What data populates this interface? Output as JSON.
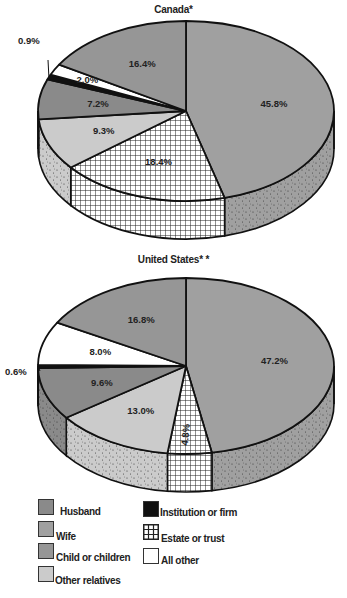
{
  "chart_data": [
    {
      "type": "pie",
      "title": "Canada*",
      "style": "3d",
      "slices": [
        {
          "label": "Wife",
          "value": 45.8,
          "text": "45.8%"
        },
        {
          "label": "Estate or trust",
          "value": 18.4,
          "text": "18.4%"
        },
        {
          "label": "Other relatives",
          "value": 9.3,
          "text": "9.3%"
        },
        {
          "label": "Husband",
          "value": 7.2,
          "text": "7.2%"
        },
        {
          "label": "Institution or firm",
          "value": 0.9,
          "text": "0.9%"
        },
        {
          "label": "All other",
          "value": 2.0,
          "text": "2.0%"
        },
        {
          "label": "Child or children",
          "value": 16.4,
          "text": "16.4%"
        }
      ]
    },
    {
      "type": "pie",
      "title": "United States* *",
      "style": "3d",
      "slices": [
        {
          "label": "Wife",
          "value": 47.2,
          "text": "47.2%"
        },
        {
          "label": "Estate or trust",
          "value": 4.8,
          "text": "4.8%"
        },
        {
          "label": "Other relatives",
          "value": 13.0,
          "text": "13.0%"
        },
        {
          "label": "Husband",
          "value": 9.6,
          "text": "9.6%"
        },
        {
          "label": "Institution or firm",
          "value": 0.6,
          "text": "0.6%"
        },
        {
          "label": "All other",
          "value": 8.0,
          "text": "8.0%"
        },
        {
          "label": "Child or children",
          "value": 16.8,
          "text": "16.8%"
        }
      ]
    }
  ],
  "legend": {
    "left": [
      {
        "label": "Husband",
        "color": "#8a8a8a"
      },
      {
        "label": "Wife",
        "color": "#a0a0a0"
      },
      {
        "label": "Child or children",
        "color": "#969696"
      },
      {
        "label": "Other relatives",
        "color": "#cbcbcb"
      }
    ],
    "right": [
      {
        "label": "Institution or firm",
        "color": "#111111"
      },
      {
        "label": "Estate or trust",
        "color": "hatch"
      },
      {
        "label": "All other",
        "color": "#ffffff"
      }
    ]
  },
  "colors": {
    "Husband": "#8a8a8a",
    "Wife": "#a0a0a0",
    "Child or children": "#969696",
    "Other relatives": "#cbcbcb",
    "Institution or firm": "#111111",
    "Estate or trust": "hatch",
    "All other": "#ffffff"
  }
}
